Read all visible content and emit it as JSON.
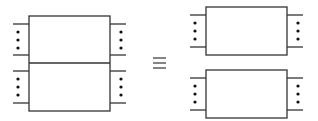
{
  "diagram": {
    "stroke_color": "#333333",
    "dot_color": "#111111",
    "relation_symbol": "≡",
    "left_side": {
      "outer_box": {
        "x": 29,
        "y": 16,
        "w": 81,
        "h": 95
      },
      "divider_y": 63,
      "legs": [
        {
          "side": "left",
          "y_top": 24,
          "y_bottom": 55
        },
        {
          "side": "left",
          "y_top": 71,
          "y_bottom": 103
        },
        {
          "side": "right",
          "y_top": 24,
          "y_bottom": 55
        },
        {
          "side": "right",
          "y_top": 71,
          "y_bottom": 103
        }
      ]
    },
    "right_side": {
      "boxes": [
        {
          "x": 206,
          "y": 7,
          "w": 81,
          "h": 48,
          "leg_top": 15,
          "leg_bottom": 47
        },
        {
          "x": 206,
          "y": 70,
          "w": 81,
          "h": 48,
          "leg_top": 78,
          "leg_bottom": 110
        }
      ]
    }
  }
}
